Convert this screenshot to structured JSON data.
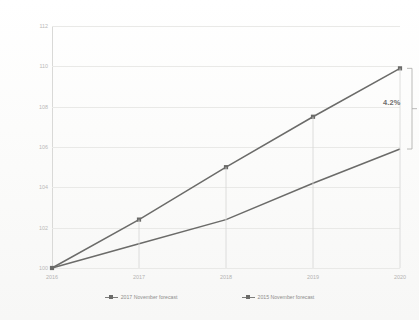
{
  "chart_data": {
    "type": "line",
    "title": "",
    "xlabel": "",
    "ylabel": "",
    "x": [
      "2016",
      "2017",
      "2018",
      "2019",
      "2020"
    ],
    "categories": [
      "2016",
      "2017",
      "2018",
      "2019",
      "2020"
    ],
    "ylim": [
      100,
      112
    ],
    "yticks": [
      "100",
      "102",
      "104",
      "106",
      "108",
      "110",
      "112"
    ],
    "ytick_values": [
      100,
      102,
      104,
      106,
      108,
      110,
      112
    ],
    "grid": true,
    "legend_position": "bottom",
    "series": [
      {
        "name": "2017 November forecast",
        "values": [
          100,
          102.4,
          105.0,
          107.5,
          109.9
        ],
        "color": "#6b6b69"
      },
      {
        "name": "2015 November forecast",
        "values": [
          100,
          101.2,
          102.4,
          104.2,
          105.9
        ],
        "color": "#6b6b69"
      }
    ],
    "annotations": [
      {
        "label": "4.2%",
        "at_x": "2020",
        "from_value": 105.9,
        "to_value": 109.9
      }
    ]
  },
  "chart": {
    "title": "",
    "annotation_label": "4.2%"
  },
  "legend": {
    "items": [
      {
        "label": "2017 November forecast"
      },
      {
        "label": "2015 November forecast"
      }
    ]
  },
  "axes": {
    "y": {
      "ticks": [
        "112",
        "110",
        "108",
        "106",
        "104",
        "102",
        "100"
      ]
    },
    "x": {
      "ticks": [
        "2016",
        "2017",
        "2018",
        "2019",
        "2020"
      ]
    }
  }
}
